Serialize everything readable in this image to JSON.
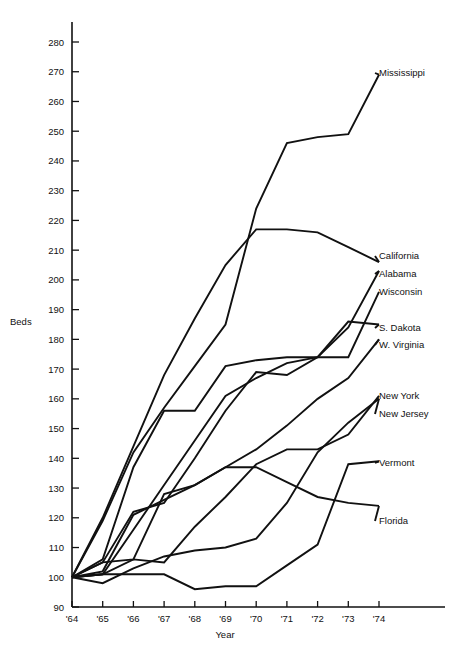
{
  "chart_data": {
    "type": "line",
    "title": "",
    "xlabel": "Year",
    "ylabel": "Beds",
    "x": [
      "'64",
      "'65",
      "'66",
      "'67",
      "'68",
      "'69",
      "'70",
      "'71",
      "'72",
      "'73",
      "'74"
    ],
    "x_values": [
      1964,
      1965,
      1966,
      1967,
      1968,
      1969,
      1970,
      1971,
      1972,
      1973,
      1974
    ],
    "xlim": [
      1964,
      1974
    ],
    "ylim": [
      90,
      285
    ],
    "ytick_labels": [
      "90",
      "100",
      "110",
      "120",
      "130",
      "140",
      "150",
      "160",
      "170",
      "180",
      "190",
      "200",
      "210",
      "220",
      "230",
      "240",
      "250",
      "260",
      "270",
      "280"
    ],
    "ytick_values": [
      90,
      100,
      110,
      120,
      130,
      140,
      150,
      160,
      170,
      180,
      190,
      200,
      210,
      220,
      230,
      240,
      250,
      260,
      270,
      280
    ],
    "grid": false,
    "legend_position": "right-inline-labels",
    "series": [
      {
        "name": "Mississippi",
        "values": [
          100,
          119,
          142,
          157,
          171,
          185,
          224,
          246,
          248,
          249,
          269
        ]
      },
      {
        "name": "California",
        "values": [
          100,
          120,
          144,
          168,
          187,
          205,
          217,
          217,
          216,
          211,
          206
        ]
      },
      {
        "name": "Alabama",
        "values": [
          100,
          101,
          116,
          131,
          146,
          161,
          167,
          172,
          174,
          184,
          203
        ]
      },
      {
        "name": "Wisconsin",
        "values": [
          100,
          105,
          122,
          125,
          140,
          156,
          169,
          168,
          174,
          174,
          196
        ]
      },
      {
        "name": "S. Dakota",
        "values": [
          100,
          106,
          137,
          156,
          156,
          171,
          173,
          174,
          174,
          186,
          185
        ]
      },
      {
        "name": "W. Virginia",
        "values": [
          100,
          102,
          121,
          126,
          131,
          137,
          143,
          151,
          160,
          167,
          180
        ]
      },
      {
        "name": "New York",
        "values": [
          100,
          101,
          106,
          105,
          117,
          127,
          138,
          143,
          143,
          148,
          161
        ]
      },
      {
        "name": "New Jersey",
        "values": [
          100,
          98,
          103,
          107,
          109,
          110,
          113,
          125,
          142,
          152,
          160
        ]
      },
      {
        "name": "Vermont",
        "values": [
          100,
          101,
          101,
          101,
          96,
          97,
          97,
          104,
          111,
          138,
          139
        ]
      },
      {
        "name": "Florida",
        "values": [
          100,
          105,
          106,
          128,
          131,
          137,
          137,
          132,
          127,
          125,
          124
        ]
      }
    ]
  },
  "labels": {
    "Mississippi": "Mississippi",
    "California": "California",
    "Alabama": "Alabama",
    "Wisconsin": "Wisconsin",
    "S. Dakota": "S. Dakota",
    "W. Virginia": "W. Virginia",
    "New York": "New York",
    "New Jersey": "New Jersey",
    "Vermont": "Vermont",
    "Florida": "Florida"
  },
  "axis": {
    "y_title": "Beds",
    "x_title": "Year"
  },
  "colors": {
    "ink": "#111111",
    "background": "#ffffff"
  }
}
